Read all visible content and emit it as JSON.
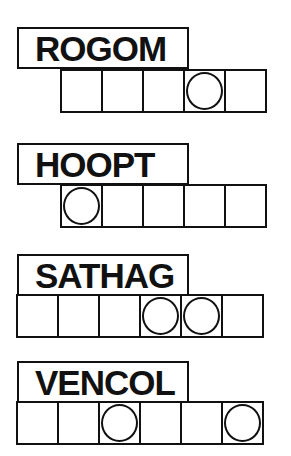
{
  "puzzles": [
    {
      "scrambled": "ROGOM",
      "letters": 5,
      "circled": [
        4
      ],
      "top": 27,
      "row_left": 60
    },
    {
      "scrambled": "HOOPT",
      "letters": 5,
      "circled": [
        1
      ],
      "top": 143,
      "row_left": 60
    },
    {
      "scrambled": "SATHAG",
      "letters": 6,
      "circled": [
        4,
        5
      ],
      "top": 254,
      "row_left": 17
    },
    {
      "scrambled": "VENCOL",
      "letters": 6,
      "circled": [
        3,
        6
      ],
      "top": 361,
      "row_left": 17
    }
  ]
}
